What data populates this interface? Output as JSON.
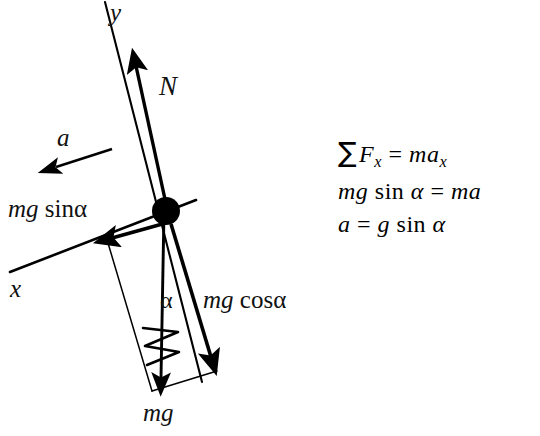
{
  "figure": {
    "kind": "free-body-diagram",
    "background_color": "#ffffff",
    "ink_color": "#000000",
    "width": 540,
    "height": 436
  },
  "axes": [
    {
      "name": "y-axis",
      "label": "y",
      "description": "tilted vertical axis through the block, thin line",
      "x1": 105,
      "y1": 2,
      "x2": 202,
      "y2": 382
    },
    {
      "name": "x-axis",
      "label": "x",
      "description": "tilted horizontal axis (incline surface) through the block",
      "x1": 10,
      "y1": 272,
      "x2": 196,
      "y2": 200
    }
  ],
  "body": {
    "name": "particle",
    "shape": "filled-circle",
    "cx": 166,
    "cy": 211,
    "r": 14,
    "color": "#000000"
  },
  "vectors": [
    {
      "name": "normal-force",
      "label": "N",
      "label_x": 159,
      "label_y": 73,
      "tail_x": 166,
      "tail_y": 211,
      "tip_x": 133,
      "tip_y": 60,
      "style": "solid-heavy",
      "direction": "up along +y (perpendicular to incline)"
    },
    {
      "name": "acceleration",
      "label": "a",
      "label_x": 57,
      "label_y": 125,
      "tail_x": 112,
      "tail_y": 149,
      "tip_x": 50,
      "tip_y": 169,
      "style": "solid-light",
      "direction": "down the incline, detached from the body"
    },
    {
      "name": "gravity-component-along-incline",
      "label": "mg sinα",
      "label_x": 8,
      "label_y": 196,
      "tail_x": 166,
      "tail_y": 223,
      "tip_x": 104,
      "tip_y": 240,
      "style": "solid-heavy",
      "direction": "down the incline (-x)"
    },
    {
      "name": "gravity-component-normal-to-incline",
      "label": "mg cosα",
      "label_x": 203,
      "label_y": 287,
      "tail_x": 170,
      "tail_y": 224,
      "tip_x": 216,
      "tip_y": 372,
      "style": "solid-heavy",
      "direction": "perpendicular into the incline (-y)"
    },
    {
      "name": "weight",
      "label": "mg",
      "label_x": 143,
      "label_y": 400,
      "tail_x": 164,
      "tail_y": 212,
      "tip_x": 160,
      "tip_y": 393,
      "style": "solid-medium",
      "direction": "straight down (true vertical)"
    }
  ],
  "angle_marks": [
    {
      "name": "angle-alpha",
      "label": "α",
      "label_x": 160,
      "label_y": 288,
      "between": [
        "weight",
        "gravity-component-normal-to-incline"
      ]
    }
  ],
  "construction_lines": [
    {
      "name": "parallelogram-side-left",
      "from_x": 108,
      "from_y": 242,
      "to_x": 152,
      "to_y": 390,
      "style": "thin"
    },
    {
      "name": "parallelogram-side-bottom",
      "from_x": 152,
      "from_y": 390,
      "to_x": 216,
      "to_y": 372,
      "style": "thin"
    }
  ],
  "marks": [
    {
      "name": "zigzag-break-mark",
      "description": "small hand-drawn zigzag crossing the weight vector",
      "cx": 160,
      "cy": 345
    }
  ],
  "equations": [
    {
      "name": "sum-forces-x",
      "text": "∑ Fₓ = maₓ",
      "parts": {
        "sigma": "∑",
        "lhs": "F",
        "lhs_sub": "x",
        "rel": "=",
        "rhs": "ma",
        "rhs_sub": "x"
      }
    },
    {
      "name": "newton-second-law-incline",
      "text": "mg sin α = ma",
      "parts": {
        "lhs": "mg",
        "fn": "sin",
        "arg": "α",
        "rel": "=",
        "rhs": "ma"
      }
    },
    {
      "name": "acceleration-result",
      "text": "a = g sin α",
      "parts": {
        "lhs": "a",
        "rel": "=",
        "rhs": "g",
        "fn": "sin",
        "arg": "α"
      }
    }
  ],
  "text_fragments": {
    "y": "y",
    "x": "x",
    "N": "N",
    "a": "a",
    "mg_sin": {
      "italic": "mg",
      "roman": " sinα"
    },
    "mg_cos": {
      "italic": "mg",
      "roman": " cosα"
    },
    "mg": "mg",
    "alpha": "α"
  }
}
